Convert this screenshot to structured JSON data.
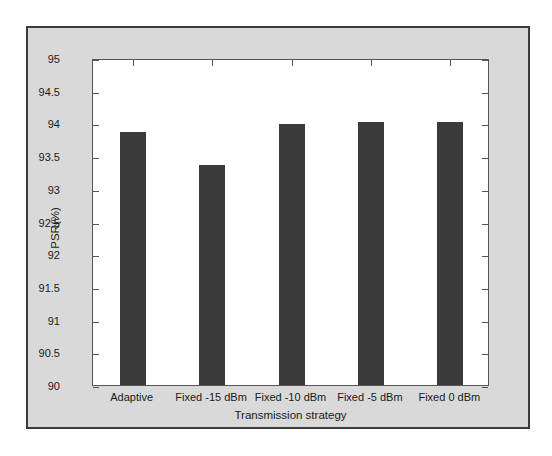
{
  "figure": {
    "background_color": "#d9d9d9",
    "border_color": "#3c3c3c",
    "plot_background_color": "#ffffff",
    "axis_color": "#555555"
  },
  "chart_data": {
    "type": "bar",
    "title": "",
    "subtitle": "",
    "xlabel": "Transmission strategy",
    "ylabel": "PSR(%)",
    "categories": [
      "Adaptive",
      "Fixed -15 dBm",
      "Fixed -10 dBm",
      "Fixed -5 dBm",
      "Fixed 0 dBm"
    ],
    "values": [
      93.87,
      93.37,
      93.99,
      94.02,
      94.02
    ],
    "bar_color": "#3a3a3a",
    "ylim": [
      90,
      95
    ],
    "yticks": [
      90,
      90.5,
      91,
      91.5,
      92,
      92.5,
      93,
      93.5,
      94,
      94.5,
      95
    ],
    "ytick_labels": [
      "90",
      "90.5",
      "91",
      "91.5",
      "92",
      "92.5",
      "93",
      "93.5",
      "94",
      "94.5",
      "95"
    ],
    "grid": false,
    "legend": null,
    "legend_position": "none",
    "annotations": []
  }
}
